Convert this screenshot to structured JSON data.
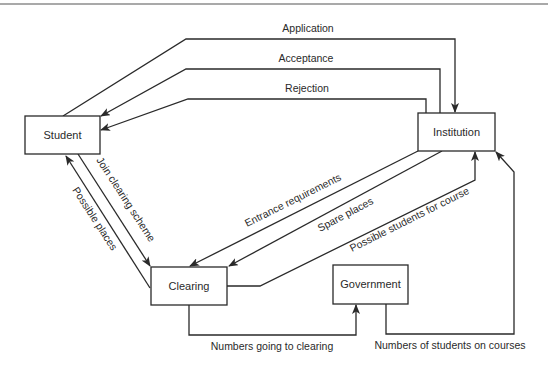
{
  "diagram": {
    "type": "data-flow",
    "nodes": {
      "student": {
        "label": "Student"
      },
      "institution": {
        "label": "Institution"
      },
      "clearing": {
        "label": "Clearing"
      },
      "government": {
        "label": "Government"
      }
    },
    "flows": {
      "application": {
        "label": "Application",
        "from": "Student",
        "to": "Institution"
      },
      "acceptance": {
        "label": "Acceptance",
        "from": "Institution",
        "to": "Student"
      },
      "rejection": {
        "label": "Rejection",
        "from": "Institution",
        "to": "Student"
      },
      "join_clearing": {
        "label": "Join clearing scheme",
        "from": "Student",
        "to": "Clearing"
      },
      "possible_places": {
        "label": "Possible places",
        "from": "Clearing",
        "to": "Student"
      },
      "entrance_requirements": {
        "label": "Entrance requirements",
        "from": "Institution",
        "to": "Clearing"
      },
      "spare_places": {
        "label": "Spare places",
        "from": "Institution",
        "to": "Clearing"
      },
      "possible_students": {
        "label": "Possible students for course",
        "from": "Clearing",
        "to": "Institution"
      },
      "numbers_clearing": {
        "label": "Numbers going to clearing",
        "from": "Clearing",
        "to": "Government"
      },
      "numbers_courses": {
        "label": "Numbers of students on courses",
        "from": "Government",
        "to": "Institution"
      }
    },
    "colors": {
      "stroke": "#2a2a2a",
      "background": "#ffffff"
    }
  }
}
